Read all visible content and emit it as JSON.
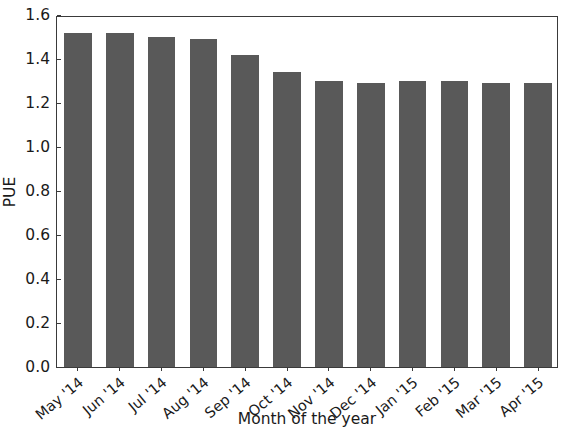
{
  "chart_data": {
    "type": "bar",
    "title": "",
    "xlabel": "Month of the year",
    "ylabel": "PUE",
    "categories": [
      "May '14",
      "Jun '14",
      "Jul '14",
      "Aug '14",
      "Sep '14",
      "Oct '14",
      "Nov '14",
      "Dec '14",
      "Jan '15",
      "Feb '15",
      "Mar '15",
      "Apr '15"
    ],
    "values": [
      1.52,
      1.52,
      1.5,
      1.49,
      1.42,
      1.34,
      1.3,
      1.29,
      1.3,
      1.3,
      1.29,
      1.29
    ],
    "series": [
      {
        "name": "PUE",
        "values": [
          1.52,
          1.52,
          1.5,
          1.49,
          1.42,
          1.34,
          1.3,
          1.29,
          1.3,
          1.3,
          1.29,
          1.29
        ]
      }
    ],
    "ylim": [
      0.0,
      1.6
    ],
    "yticks": [
      "0.0",
      "0.2",
      "0.4",
      "0.6",
      "0.8",
      "1.0",
      "1.2",
      "1.4",
      "1.6"
    ],
    "ytick_values": [
      0.0,
      0.2,
      0.4,
      0.6,
      0.8,
      1.0,
      1.2,
      1.4,
      1.6
    ],
    "grid": false,
    "legend": null,
    "legend_position": "none",
    "bar_color": "#595959",
    "axis_color": "#3a3a3a",
    "background_color": "#ffffff",
    "bar_width_ratio": 0.66,
    "xtick_rotation": -40
  }
}
